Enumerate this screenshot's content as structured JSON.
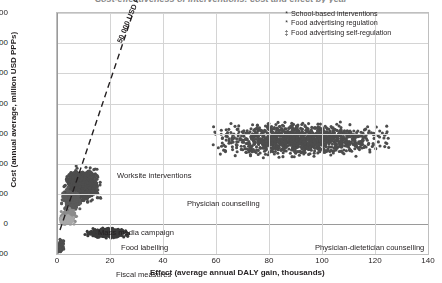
{
  "chart": {
    "title": "Cost-effectiveness of interventions: cost and effect by year",
    "xlabel": "Effect (average annual DALY gain, thousands)",
    "ylabel": "Cost (annual average, million USD PPPs)",
    "threshold_label": "50 000 USD PPP/DALY"
  },
  "legend": {
    "items": [
      {
        "marker": "*",
        "label": "School-based interventions"
      },
      {
        "marker": "*",
        "label": "Food advertising regulation"
      },
      {
        "marker": "‡",
        "label": "Food advertising self-regulation"
      }
    ]
  },
  "annotations": {
    "worksite": "Worksite interventions",
    "physician": "Physician counselling",
    "mass_media": "Mass media campaign",
    "food_labelling": "Food labelling",
    "fiscal": "Fiscal measures",
    "dietetician": "Physician-dietetician counselling"
  },
  "ticks": {
    "y": [
      "1,400",
      "1,200",
      "1,000",
      "800",
      "600",
      "400",
      "200",
      "0",
      "-200"
    ],
    "x": [
      "0",
      "20",
      "40",
      "60",
      "80",
      "100",
      "120",
      "140"
    ]
  },
  "chart_data": {
    "type": "scatter",
    "title": "Cost-effectiveness of interventions: cost and effect by year",
    "xlabel": "Effect (average annual DALY gain, thousands)",
    "ylabel": "Cost (annual average, million USD PPPs)",
    "xlim": [
      0,
      140
    ],
    "ylim": [
      -200,
      1400
    ],
    "xticks": [
      0,
      20,
      40,
      60,
      80,
      100,
      120,
      140
    ],
    "yticks": [
      -200,
      0,
      200,
      400,
      600,
      800,
      1000,
      1200,
      1400
    ],
    "grid": true,
    "legend_position": "top-right",
    "marker_color": "#4d4d4d",
    "threshold_line": {
      "label": "50 000 USD PPP/DALY",
      "slope_usd_per_daly": 50000,
      "style": "dashed",
      "x_range": [
        0,
        28
      ],
      "y_range": [
        -40,
        1400
      ]
    },
    "series": [
      {
        "name": "Physician-dietetician counselling",
        "color": "#4d4d4d",
        "n_points": 1400,
        "x_center": 92,
        "x_spread": 16,
        "y_center": 560,
        "y_spread": 55,
        "x_range": [
          58,
          132
        ],
        "y_range": [
          420,
          700
        ]
      },
      {
        "name": "Physician counselling",
        "color": "#4d4d4d",
        "n_points": 1100,
        "x_center": 9.5,
        "x_spread": 3.2,
        "y_center": 255,
        "y_spread": 55,
        "x_range": [
          2,
          20
        ],
        "y_range": [
          120,
          420
        ]
      },
      {
        "name": "Worksite interventions",
        "color": "#5a5a5a",
        "n_points": 260,
        "x_center": 5.5,
        "x_spread": 1.8,
        "y_center": 160,
        "y_spread": 35,
        "x_range": [
          1,
          11
        ],
        "y_range": [
          90,
          250
        ]
      },
      {
        "name": "Mass media campaign",
        "color": "#8c8c8c",
        "n_points": 180,
        "x_center": 4.2,
        "x_spread": 1.6,
        "y_center": 55,
        "y_spread": 22,
        "x_range": [
          1,
          9
        ],
        "y_range": [
          15,
          110
        ]
      },
      {
        "name": "Food labelling",
        "color": "#a8a8a8",
        "n_points": 150,
        "x_center": 3.6,
        "x_spread": 1.4,
        "y_center": 22,
        "y_spread": 16,
        "x_range": [
          1,
          8
        ],
        "y_range": [
          -5,
          65
        ]
      },
      {
        "name": "Fiscal measures",
        "color": "#3a3a3a",
        "n_points": 520,
        "x_center": 19,
        "x_spread": 4.0,
        "y_center": -60,
        "y_spread": 16,
        "x_range": [
          9,
          30
        ],
        "y_range": [
          -105,
          -15
        ]
      },
      {
        "name": "School-based interventions",
        "color": "#4d4d4d",
        "n_points": 40,
        "x_center": 1.6,
        "x_spread": 0.7,
        "y_center": -140,
        "y_spread": 18,
        "x_range": [
          0.3,
          3.5
        ],
        "y_range": [
          -185,
          -95
        ]
      },
      {
        "name": "Food advertising regulation",
        "color": "#4d4d4d",
        "n_points": 24,
        "x_center": 1.1,
        "x_spread": 0.5,
        "y_center": -165,
        "y_spread": 10,
        "x_range": [
          0.2,
          2.4
        ],
        "y_range": [
          -190,
          -130
        ]
      },
      {
        "name": "Food advertising self-regulation",
        "color": "#4d4d4d",
        "n_points": 18,
        "x_center": 0.9,
        "x_spread": 0.4,
        "y_center": -175,
        "y_spread": 8,
        "x_range": [
          0.2,
          2.0
        ],
        "y_range": [
          -195,
          -150
        ]
      }
    ]
  }
}
